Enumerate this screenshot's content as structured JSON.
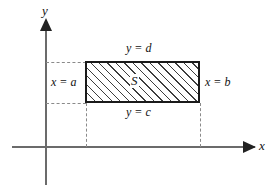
{
  "figure": {
    "kind": "math-diagram",
    "background_color": "#ffffff",
    "line_color": "#1a1a1a",
    "axis_color": "#6b6b6b",
    "guide_color": "#8a8a8a",
    "hatch_color": "#3d3d3d"
  },
  "axes": {
    "y_label": "y",
    "x_label": "x",
    "y_axis_name": "vertical axis",
    "x_axis_name": "horizontal axis"
  },
  "region": {
    "label": "S",
    "fill": "diagonal-hatch",
    "left_boundary": "x = a",
    "right_boundary": "x = b",
    "bottom_boundary": "y = c",
    "top_boundary": "y = d"
  },
  "guides": {
    "top_dashed": "y = d projection to y-axis",
    "bottom_dashed": "y = c projection to y-axis",
    "left_dashed": "x = a projection to x-axis",
    "right_dashed": "x = b projection to x-axis"
  }
}
